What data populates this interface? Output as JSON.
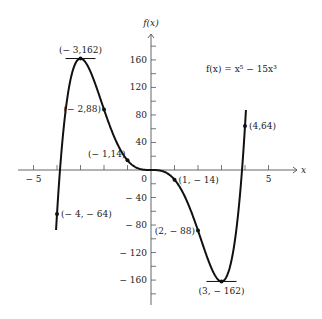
{
  "chart_data": {
    "type": "line",
    "title": "",
    "function_label": "f(x) = x⁵ − 15x³",
    "xlabel": "x",
    "ylabel": "f(x)",
    "xlim": [
      -5.6,
      6.8
    ],
    "ylim": [
      -190,
      205
    ],
    "x_ticks": [
      -5,
      -4,
      -3,
      -2,
      -1,
      1,
      2,
      3,
      4,
      5
    ],
    "x_tick_labels": [
      {
        "value": -5,
        "text": "− 5"
      },
      {
        "value": 5,
        "text": "5"
      }
    ],
    "y_ticks": [
      -180,
      -160,
      -140,
      -120,
      -100,
      -80,
      -60,
      -40,
      -20,
      20,
      40,
      60,
      80,
      100,
      120,
      140,
      160,
      180
    ],
    "y_tick_labels": [
      {
        "value": 160,
        "text": "160"
      },
      {
        "value": 120,
        "text": "120"
      },
      {
        "value": 80,
        "text": "80"
      },
      {
        "value": 40,
        "text": "40"
      },
      {
        "value": 0,
        "text": "0"
      },
      {
        "value": -40,
        "text": "− 40"
      },
      {
        "value": -80,
        "text": "− 80"
      },
      {
        "value": -120,
        "text": "− 120"
      },
      {
        "value": -160,
        "text": "− 160"
      }
    ],
    "grid": false,
    "series": [
      {
        "name": "f(x) = x^5 - 15x^3",
        "x_range": [
          -4.04,
          4.04
        ],
        "coefficients": {
          "x5": 1,
          "x3": -15
        }
      }
    ],
    "points": [
      {
        "x": -4,
        "y": -64,
        "label": "(− 4, − 64)",
        "anchor": "right"
      },
      {
        "x": -3,
        "y": 162,
        "label": "(− 3,162)",
        "anchor": "above",
        "tangent": true
      },
      {
        "x": -2,
        "y": 88,
        "label": "(− 2,88)",
        "anchor": "left"
      },
      {
        "x": -1,
        "y": 14,
        "label": "(− 1,14)",
        "anchor": "left-above"
      },
      {
        "x": 1,
        "y": -14,
        "label": "(1, − 14)",
        "anchor": "right"
      },
      {
        "x": 2,
        "y": -88,
        "label": "(2, − 88)",
        "anchor": "left"
      },
      {
        "x": 3,
        "y": -162,
        "label": "(3, − 162)",
        "anchor": "below",
        "tangent": true
      },
      {
        "x": 4,
        "y": 64,
        "label": "(4,64)",
        "anchor": "right"
      }
    ]
  }
}
